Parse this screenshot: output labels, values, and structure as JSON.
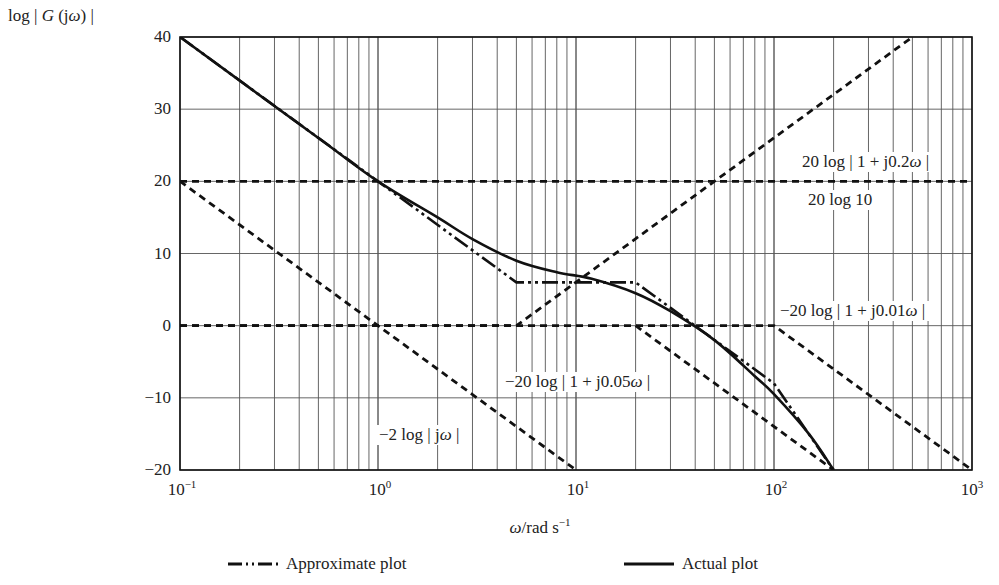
{
  "chart_data": {
    "type": "line",
    "title": "",
    "xlabel": "ω/rad s⁻¹",
    "ylabel": "log | G (jω) |",
    "xscale": "log",
    "xlim": [
      0.1,
      1000
    ],
    "ylim": [
      -20,
      40
    ],
    "grid": true,
    "x_tick_labels": [
      "10⁻¹",
      "10⁰",
      "10¹",
      "10²",
      "10³"
    ],
    "x_ticks": [
      0.1,
      1,
      10,
      100,
      1000
    ],
    "y_ticks": [
      -20,
      -10,
      0,
      10,
      20,
      30,
      40
    ],
    "y_tick_labels": [
      "−20",
      "−10",
      "0",
      "10",
      "20",
      "30",
      "40"
    ],
    "series": [
      {
        "name": "Approximate plot",
        "style": "dash-dot-dot",
        "x": [
          0.1,
          1,
          5,
          20,
          100,
          200
        ],
        "y": [
          40,
          20,
          6,
          6,
          -8,
          -20
        ]
      },
      {
        "name": "Actual plot",
        "style": "solid",
        "x": [
          0.1,
          0.5,
          1,
          2,
          3,
          5,
          8,
          12,
          20,
          30,
          50,
          80,
          100,
          150,
          200
        ],
        "y": [
          40,
          26,
          20,
          15,
          12,
          9,
          7.4,
          6.5,
          4.5,
          2,
          -2,
          -7,
          -9.5,
          -15,
          -20
        ]
      },
      {
        "name": "20 log 10",
        "style": "dashed",
        "x": [
          0.1,
          1000
        ],
        "y": [
          20,
          20
        ]
      },
      {
        "name": "−2 log | jω |",
        "style": "dashed",
        "x": [
          0.1,
          10
        ],
        "y": [
          20,
          -20
        ]
      },
      {
        "name": "20 log | 1 + j0.2ω |",
        "style": "dashed",
        "x": [
          0.1,
          5,
          500
        ],
        "y": [
          0,
          0,
          40
        ]
      },
      {
        "name": "−20 log | 1 + j0.05ω |",
        "style": "dashed",
        "x": [
          20,
          200
        ],
        "y": [
          0,
          -20
        ]
      },
      {
        "name": "−20 log | 1 + j0.01ω |",
        "style": "dashed",
        "x": [
          0.1,
          100,
          1000
        ],
        "y": [
          0,
          0,
          -20
        ]
      }
    ],
    "annotations": [
      {
        "text": "20 log | 1 + j0.2ω |",
        "x": 200,
        "y": 23.5
      },
      {
        "text": "20 log 10",
        "x": 200,
        "y": 16.5
      },
      {
        "text": "−20 log | 1 + j0.01ω |",
        "x": 200,
        "y": 1.5
      },
      {
        "text": "−20 log | 1 + j0.05ω |",
        "x": 22,
        "y": -7.5
      },
      {
        "text": "−2 log | jω |",
        "x": 1.8,
        "y": -15
      }
    ],
    "legend": {
      "position": "bottom",
      "entries": [
        "Approximate plot",
        "Actual plot"
      ]
    }
  },
  "labels": {
    "ylabel_prefix": "log | ",
    "ylabel_g": "G",
    "ylabel_mid": " (j",
    "ylabel_omega": "ω",
    "ylabel_suffix": ") |",
    "xlabel_omega": "ω",
    "xlabel_unit": "/rad s",
    "xlabel_exp": "−1",
    "yticks": [
      "40",
      "30",
      "20",
      "10",
      "0",
      "−10",
      "−20"
    ],
    "xticks": [
      {
        "base": "10",
        "exp": "−1"
      },
      {
        "base": "10",
        "exp": "0"
      },
      {
        "base": "10",
        "exp": "1"
      },
      {
        "base": "10",
        "exp": "2"
      },
      {
        "base": "10",
        "exp": "3"
      }
    ],
    "annot_02_prefix": "20 log | 1 + j0.2",
    "annot_02_omega": "ω",
    "annot_02_suffix": " |",
    "annot_20log10": "20 log 10",
    "annot_001_prefix": "−20 log | 1 + j0.01",
    "annot_001_omega": "ω",
    "annot_001_suffix": " |",
    "annot_005_prefix": "−20 log | 1 + j0.05",
    "annot_005_omega": "ω",
    "annot_005_suffix": " |",
    "annot_jw_prefix": "−2 log | j",
    "annot_jw_omega": "ω",
    "annot_jw_suffix": " |",
    "legend_approx": "Approximate plot",
    "legend_actual": "Actual plot"
  }
}
